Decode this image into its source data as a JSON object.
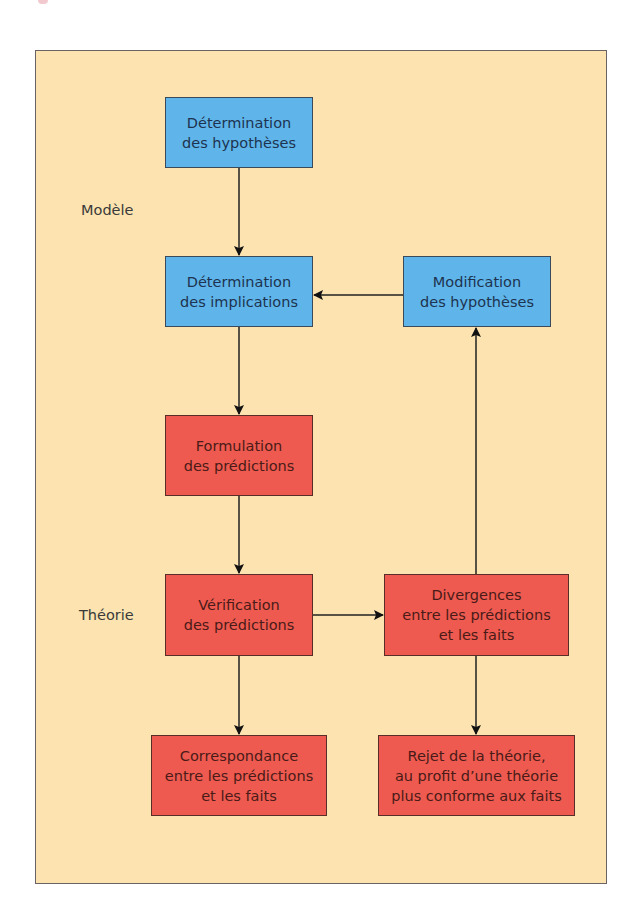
{
  "diagram": {
    "section_labels": {
      "model": "Modèle",
      "theory": "Théorie"
    },
    "boxes": {
      "hypotheses": {
        "text": "Détermination\ndes hypothèses",
        "color": "#5fb5ea"
      },
      "implications": {
        "text": "Détermination\ndes implications",
        "color": "#5fb5ea"
      },
      "modification": {
        "text": "Modification\ndes hypothèses",
        "color": "#5fb5ea"
      },
      "formulation": {
        "text": "Formulation\ndes prédictions",
        "color": "#ee5a4f"
      },
      "verification": {
        "text": "Vérification\ndes prédictions",
        "color": "#ee5a4f"
      },
      "divergences": {
        "text": "Divergences\nentre les prédictions\net les faits",
        "color": "#ee5a4f"
      },
      "correspondance": {
        "text": "Correspondance\nentre les prédictions\net les faits",
        "color": "#ee5a4f"
      },
      "rejet": {
        "text": "Rejet de la théorie,\nau profit d’une théorie\nplus conforme aux faits",
        "color": "#ee5a4f"
      }
    },
    "edges": [
      [
        "hypotheses",
        "implications"
      ],
      [
        "implications",
        "formulation"
      ],
      [
        "formulation",
        "verification"
      ],
      [
        "verification",
        "divergences"
      ],
      [
        "verification",
        "correspondance"
      ],
      [
        "divergences",
        "rejet"
      ],
      [
        "divergences",
        "modification"
      ],
      [
        "modification",
        "implications"
      ]
    ],
    "colors": {
      "background": "#fce3b0",
      "model_boxes": "#5fb5ea",
      "theory_boxes": "#ee5a4f",
      "frame_border": "#6a6363"
    }
  }
}
